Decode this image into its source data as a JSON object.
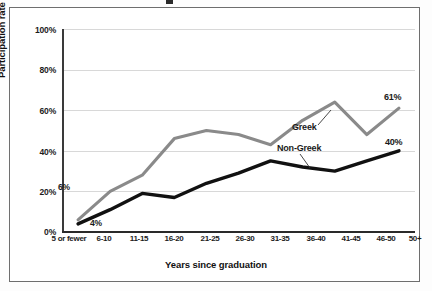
{
  "chart_data": {
    "type": "line",
    "title": "",
    "xlabel": "Years since graduation",
    "ylabel": "Participation rate",
    "ylim": [
      0,
      100
    ],
    "grid": true,
    "legend_position": "inline-annotations",
    "categories": [
      "5 or fewer",
      "6-10",
      "11-15",
      "16-20",
      "21-25",
      "26-30",
      "31-35",
      "36-40",
      "41-45",
      "46-50",
      "50+"
    ],
    "ytick_labels": [
      "100%",
      "80%",
      "60%",
      "40%",
      "20%",
      "0%"
    ],
    "ytick_values": [
      100,
      80,
      60,
      40,
      20,
      0
    ],
    "series": [
      {
        "name": "Greek",
        "color": "#8a8a8a",
        "values": [
          6,
          20,
          28,
          46,
          50,
          48,
          43,
          55,
          64,
          48,
          61
        ]
      },
      {
        "name": "Non-Greek",
        "color": "#111111",
        "values": [
          4,
          11,
          19,
          17,
          24,
          29,
          35,
          32,
          30,
          35,
          40
        ]
      }
    ],
    "annotations": [
      {
        "text": "6%",
        "series": "Greek",
        "point_index": 0
      },
      {
        "text": "4%",
        "series": "Non-Greek",
        "point_index": 0
      },
      {
        "text": "61%",
        "series": "Greek",
        "point_index": 10
      },
      {
        "text": "40%",
        "series": "Non-Greek",
        "point_index": 10
      }
    ],
    "series_labels": [
      {
        "text": "Greek"
      },
      {
        "text": "Non-Greek"
      }
    ]
  },
  "axis": {
    "y_title": "Participation rate",
    "x_title": "Years since graduation",
    "yticks": [
      "100%",
      "80%",
      "60%",
      "40%",
      "20%",
      "0%"
    ],
    "xticks": [
      "5 or fewer",
      "6-10",
      "11-15",
      "16-20",
      "21-25",
      "26-30",
      "31-35",
      "36-40",
      "41-45",
      "46-50",
      "50+"
    ]
  },
  "labels": {
    "greek": "Greek",
    "non_greek": "Non-Greek",
    "greek_start": "6%",
    "non_greek_start": "4%",
    "greek_end": "61%",
    "non_greek_end": "40%"
  },
  "colors": {
    "greek_line": "#8a8a8a",
    "non_greek_line": "#111111",
    "gridline": "#d8d8d8",
    "axis": "#2a2a2a",
    "frame": "#6e6e6e",
    "background": "#ffffff"
  }
}
